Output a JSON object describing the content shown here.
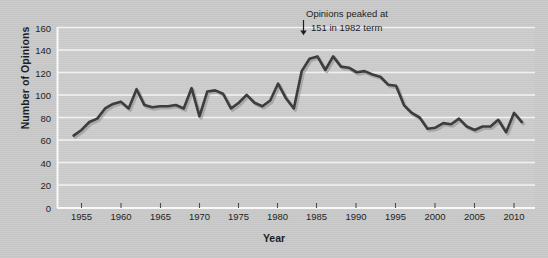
{
  "figure": {
    "background_color": "#c9c9c9",
    "plot_background_color": "#cccccc",
    "gridline_color": "#f2f2f2",
    "line_color": "#3a3a3a",
    "text_color": "#1b1b1b"
  },
  "axis": {
    "ylabel": "Number of Opinions",
    "xlabel": "Year",
    "y_ticks": [
      "0",
      "20",
      "40",
      "60",
      "80",
      "100",
      "120",
      "140",
      "160"
    ],
    "x_ticks": [
      "1955",
      "1960",
      "1965",
      "1970",
      "1975",
      "1980",
      "1985",
      "1990",
      "1995",
      "2000",
      "2005",
      "2010"
    ]
  },
  "annotation": {
    "line1": "Opinions peaked at",
    "line2": "151 in 1982 term",
    "arrow_glyph": "down-arrow"
  },
  "chart_data": {
    "type": "line",
    "title": "",
    "subtitle": "",
    "xlabel": "Year",
    "ylabel": "Number of Opinions",
    "xlim": [
      1954,
      2012
    ],
    "ylim": [
      0,
      160
    ],
    "grid": true,
    "legend": null,
    "annotations": [
      {
        "text": "Opinions peaked at 151 in 1982 term",
        "points_to_x": 1982,
        "points_to_y": 151
      }
    ],
    "series": [
      {
        "name": "Number of Opinions",
        "color": "#3a3a3a",
        "x": [
          1954,
          1955,
          1956,
          1957,
          1958,
          1959,
          1960,
          1961,
          1962,
          1963,
          1964,
          1965,
          1966,
          1967,
          1968,
          1969,
          1970,
          1971,
          1972,
          1973,
          1974,
          1975,
          1976,
          1977,
          1978,
          1979,
          1980,
          1981,
          1982,
          1983,
          1984,
          1985,
          1986,
          1987,
          1988,
          1989,
          1990,
          1991,
          1992,
          1993,
          1994,
          1995,
          1996,
          1997,
          1998,
          1999,
          2000,
          2001,
          2002,
          2003,
          2004,
          2005,
          2006,
          2007,
          2008,
          2009,
          2010,
          2011
        ],
        "values": [
          64,
          69,
          76,
          79,
          88,
          92,
          94,
          88,
          105,
          91,
          89,
          90,
          90,
          91,
          88,
          106,
          81,
          103,
          104,
          101,
          88,
          93,
          100,
          93,
          90,
          95,
          110,
          97,
          88,
          121,
          132,
          134,
          122,
          134,
          125,
          124,
          120,
          121,
          118,
          116,
          109,
          108,
          91,
          84,
          80,
          70,
          71,
          75,
          74,
          79,
          72,
          69,
          72,
          72,
          78,
          67,
          84,
          76
        ]
      }
    ]
  }
}
